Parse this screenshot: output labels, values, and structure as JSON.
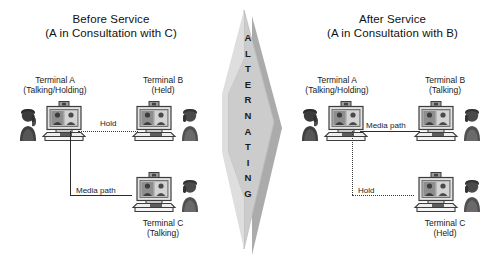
{
  "diagram": {
    "title_before_line1": "Before Service",
    "title_before_line2": "(A in Consultation with C)",
    "title_after_line1": "After Service",
    "title_after_line2": "(A in Consultation with B)",
    "alternating_label": "ALTERNATING",
    "colors": {
      "arrow_fill": "#c9c9c9",
      "arrow_shadow": "#a6a6a6",
      "line": "#2b2b2b",
      "text": "#1a1a1a",
      "terminal_body": "#d8d8d8",
      "terminal_outline": "#3c3c3c",
      "person": "#4a4a4a"
    }
  },
  "before": {
    "terminal_a": {
      "name": "Terminal A",
      "state": "(Talking/Holding)"
    },
    "terminal_b": {
      "name": "Terminal B",
      "state": "(Held)"
    },
    "terminal_c": {
      "name": "Terminal C",
      "state": "(Talking)"
    },
    "link_hold": "Hold",
    "link_media": "Media path"
  },
  "after": {
    "terminal_a": {
      "name": "Terminal A",
      "state": "(Talking/Holding)"
    },
    "terminal_b": {
      "name": "Terminal B",
      "state": "(Talking)"
    },
    "terminal_c": {
      "name": "Terminal C",
      "state": "(Held)"
    },
    "link_hold": "Hold",
    "link_media": "Media path"
  }
}
